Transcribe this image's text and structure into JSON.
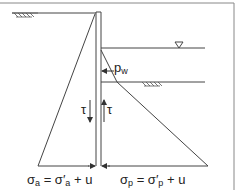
{
  "diagram": {
    "colors": {
      "line": "#444444",
      "frame": "#888888",
      "background": "#ffffff"
    },
    "symbols": {
      "water_table": "inverted-triangle",
      "ground_hatch": "soil-hatch"
    },
    "labels": {
      "water_pressure": {
        "main": "p",
        "sub": "w"
      },
      "shear_left": "τ",
      "shear_right": "τ",
      "active_equation": {
        "sigma": "σ",
        "sub": "a",
        "eq": " = σ′",
        "sub2": "a",
        "rest": " + u"
      },
      "passive_equation": {
        "sigma": "σ",
        "sub": "p",
        "eq": " = σ′",
        "sub2": "p",
        "rest": " + u"
      }
    }
  }
}
